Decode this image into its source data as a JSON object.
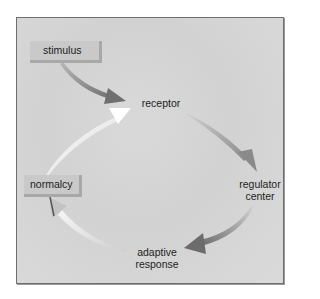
{
  "diagram": {
    "title": "",
    "type": "feedback-loop",
    "nodes": {
      "stimulus": "stimulus",
      "receptor": "receptor",
      "regulator_line1": "regulator",
      "regulator_line2": "center",
      "adaptive_line1": "adaptive",
      "adaptive_line2": "response",
      "normalcy": "normalcy"
    },
    "edges": [
      {
        "from": "stimulus",
        "to": "receptor"
      },
      {
        "from": "receptor",
        "to": "regulator center"
      },
      {
        "from": "regulator center",
        "to": "adaptive response"
      },
      {
        "from": "adaptive response",
        "to": "normalcy"
      },
      {
        "from": "normalcy",
        "to": "receptor"
      }
    ],
    "colors": {
      "frame_border": "#6e6e6e",
      "background": "#d6d6d6",
      "box_fill": "#c9c9c9",
      "dark_arrow": "#7a7a7a",
      "light_arrow": "#f2f2f2",
      "text": "#1e1e1e"
    }
  }
}
